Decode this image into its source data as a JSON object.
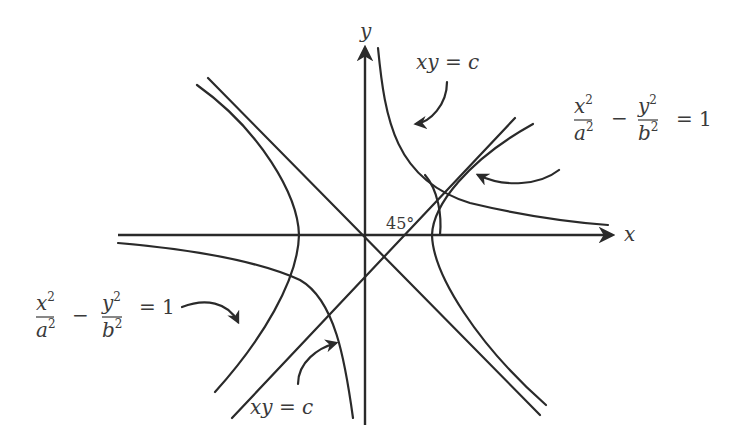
{
  "diagram": {
    "axes": {
      "x_label": "x",
      "y_label": "y"
    },
    "angle_label": "45°",
    "labels": {
      "xy_top": "xy = c",
      "xy_bottom": "xy = c",
      "hyperbola_right": {
        "num1": "x",
        "sup1": "2",
        "den1": "a",
        "dsup1": "2",
        "minus": "−",
        "num2": "y",
        "sup2": "2",
        "den2": "b",
        "dsup2": "2",
        "rhs": "= 1"
      },
      "hyperbola_left": {
        "num1": "x",
        "sup1": "2",
        "den1": "a",
        "dsup1": "2",
        "minus": "−",
        "num2": "y",
        "sup2": "2",
        "den2": "b",
        "dsup2": "2",
        "rhs": "= 1"
      }
    },
    "stroke_color": "#2a2a2a",
    "text_color": "#3a3a3a"
  }
}
